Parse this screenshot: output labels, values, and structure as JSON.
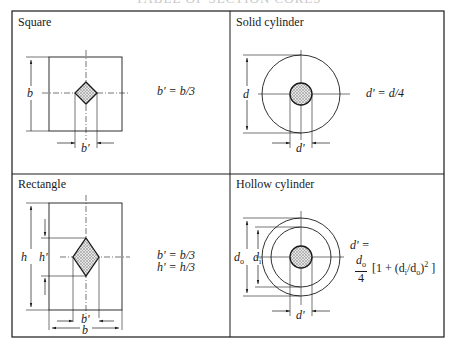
{
  "figure": {
    "heading_cut": "TABLE OF SECTION CORES",
    "panels": [
      {
        "id": "square",
        "title": "Square",
        "formula": "b' = b/3",
        "labels": {
          "side": "b",
          "core": "b'"
        }
      },
      {
        "id": "solid-cylinder",
        "title": "Solid cylinder",
        "formula": "d' = d/4",
        "labels": {
          "diameter": "d",
          "core": "d'"
        }
      },
      {
        "id": "rectangle",
        "title": "Rectangle",
        "formulas": [
          "b' = b/3",
          "h' = h/3"
        ],
        "labels": {
          "height": "h",
          "core_height": "h'",
          "width": "b",
          "core_width": "b'"
        }
      },
      {
        "id": "hollow-cylinder",
        "title": "Hollow cylinder",
        "formula_lhs": "d' =",
        "formula_num": "d",
        "formula_num_sub": "o",
        "formula_den": "4",
        "formula_rest": "[1 + (d",
        "formula_rest_sub_i": "i",
        "formula_rest_mid": "/d",
        "formula_rest_sub_o": "o",
        "formula_rest_end": ")",
        "formula_sup": "2",
        "formula_close": " ]",
        "labels": {
          "outer": "d",
          "outer_sub": "o",
          "inner": "d",
          "inner_sub": "i",
          "core": "d'"
        }
      }
    ],
    "colors": {
      "line": "#1a1a1a",
      "hatch": "#9a9a9a",
      "background": "#ffffff"
    }
  }
}
